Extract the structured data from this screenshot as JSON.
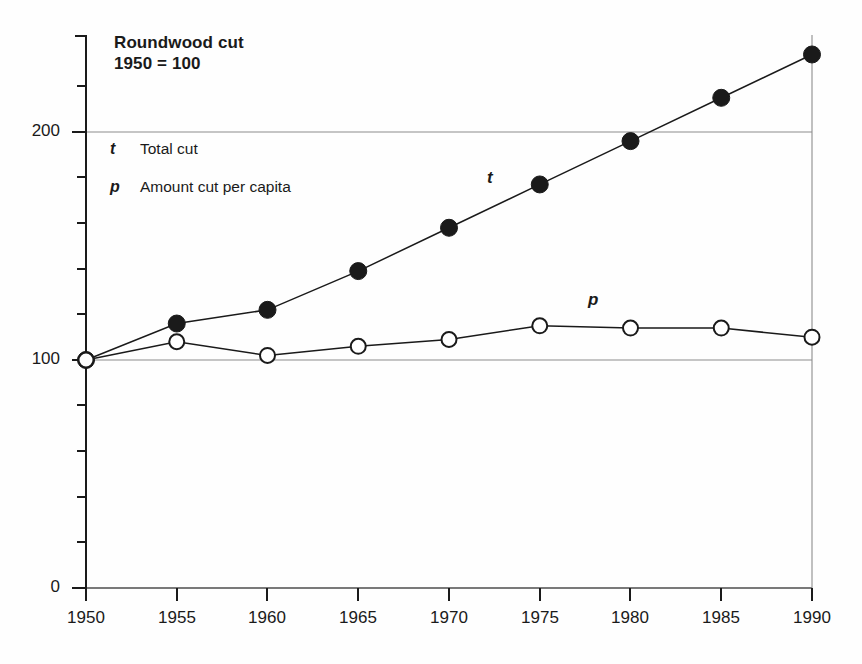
{
  "chart_data": {
    "type": "line",
    "title": "Roundwood cut",
    "subtitle": "1950 = 100",
    "xlabel": "",
    "ylabel": "",
    "x": [
      1950,
      1955,
      1960,
      1965,
      1970,
      1975,
      1980,
      1985,
      1990
    ],
    "categories": [
      "1950",
      "1955",
      "1960",
      "1965",
      "1970",
      "1975",
      "1980",
      "1985",
      "1990"
    ],
    "series": [
      {
        "name": "t",
        "legend": "Total cut",
        "marker": "filled-circle",
        "values": [
          100,
          116,
          122,
          139,
          158,
          177,
          196,
          215,
          234
        ]
      },
      {
        "name": "p",
        "legend": "Amount cut per capita",
        "marker": "open-circle",
        "values": [
          100,
          108,
          102,
          106,
          109,
          115,
          114,
          114,
          110
        ]
      }
    ],
    "ylim": [
      0,
      240
    ],
    "xlim": [
      1950,
      1990
    ],
    "yticks_labeled": [
      "0",
      "100",
      "200"
    ],
    "ytick_values_labeled": [
      0,
      100,
      200
    ],
    "ytick_minor_step": 20,
    "gridlines": [
      "y=100",
      "y=200",
      "x=1990"
    ],
    "grid": true,
    "legend_position": "inside-top-left",
    "annotations": [
      {
        "text": "t",
        "x": 1973,
        "y": 182
      },
      {
        "text": "p",
        "x": 1978,
        "y": 125
      }
    ]
  },
  "axes": {
    "y_labels": [
      "200",
      "100",
      "0"
    ],
    "x_labels": [
      "1950",
      "1955",
      "1960",
      "1965",
      "1970",
      "1975",
      "1980",
      "1985",
      "1990"
    ]
  },
  "legend": {
    "items": [
      {
        "key": "t",
        "label": "Total cut"
      },
      {
        "key": "p",
        "label": "Amount cut per capita"
      }
    ]
  },
  "header": {
    "title": "Roundwood cut",
    "subtitle": "1950 = 100"
  },
  "colors": {
    "ink": "#1a1a1a",
    "grid": "#8c8c8c",
    "background": "#fefefe"
  }
}
